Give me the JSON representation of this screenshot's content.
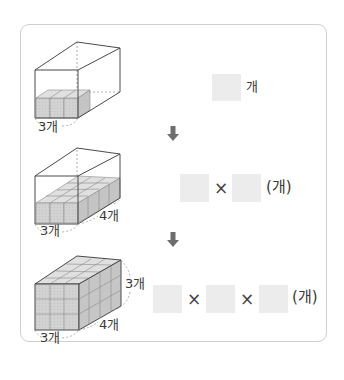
{
  "steps": [
    {
      "labels": {
        "width": "3개"
      },
      "answer": {
        "unit": "개"
      }
    },
    {
      "labels": {
        "width": "3개",
        "depth": "4개"
      },
      "answer": {
        "operator": "×",
        "unit": "(개)"
      }
    },
    {
      "labels": {
        "width": "3개",
        "depth": "4개",
        "height": "3개"
      },
      "answer": {
        "operator1": "×",
        "operator2": "×",
        "unit": "(개)"
      }
    }
  ],
  "colors": {
    "frame_border": "#cfcfcf",
    "answer_box": "#ececec",
    "cube_fill": "#d4d4d4",
    "cube_top": "#e2e2e2",
    "cube_side": "#bdbdbd",
    "arrow": "#6e6e6e",
    "edge": "#4a4a4a"
  }
}
